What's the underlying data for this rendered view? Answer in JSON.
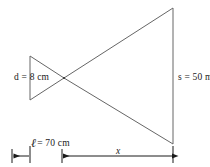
{
  "figure": {
    "type": "geometric-optics-diagram",
    "stroke_color": "#555555",
    "text_color": "#1a1a1a",
    "background_color": "#ffffff",
    "labels": {
      "d": "d = 8 cm",
      "s": "s = 50 m",
      "ell_symbol": "ℓ",
      "ell_value": "= 70 cm",
      "x": "x"
    },
    "geometry": {
      "apex": {
        "x": 64,
        "y": 78
      },
      "small_triangle": {
        "base_x": 30,
        "top_y": 56,
        "bottom_y": 100
      },
      "large_triangle": {
        "base_x": 173,
        "top_y": 8,
        "bottom_y": 144
      },
      "dimension_line": {
        "y": 156,
        "ticks": [
          12,
          30,
          62,
          173
        ],
        "segments": [
          {
            "name": "ell",
            "from": 12,
            "to": 30
          },
          {
            "name": "x",
            "from": 62,
            "to": 173
          }
        ]
      }
    }
  }
}
